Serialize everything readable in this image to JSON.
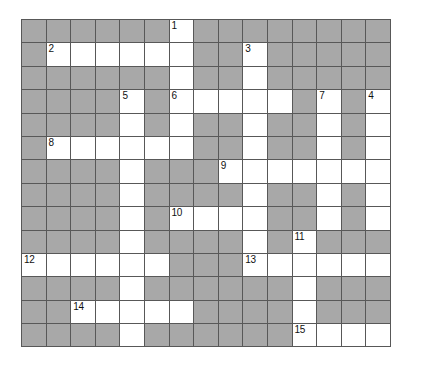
{
  "puzzle": {
    "title": "Crossword Grid",
    "rows": 14,
    "cols": 15,
    "colors": {
      "block": "#a8a8a8",
      "open": "#ffffff",
      "grid_line": "#585858",
      "number_text": "#111111",
      "page_background": "#ffffff"
    },
    "clue_numbers_visible": [
      "1",
      "2",
      "3",
      "4",
      "5",
      "6",
      "7",
      "8",
      "9",
      "10",
      "11",
      "12",
      "13",
      "14",
      "15"
    ],
    "cells": [
      [
        {
          "t": "block"
        },
        {
          "t": "block"
        },
        {
          "t": "block"
        },
        {
          "t": "block"
        },
        {
          "t": "block"
        },
        {
          "t": "block"
        },
        {
          "t": "open",
          "n": "1"
        },
        {
          "t": "block"
        },
        {
          "t": "block"
        },
        {
          "t": "block"
        },
        {
          "t": "block"
        },
        {
          "t": "block"
        },
        {
          "t": "block"
        },
        {
          "t": "block"
        },
        {
          "t": "block"
        }
      ],
      [
        {
          "t": "block"
        },
        {
          "t": "open",
          "n": "2"
        },
        {
          "t": "open"
        },
        {
          "t": "open"
        },
        {
          "t": "open"
        },
        {
          "t": "open"
        },
        {
          "t": "open"
        },
        {
          "t": "block"
        },
        {
          "t": "block"
        },
        {
          "t": "open",
          "n": "3"
        },
        {
          "t": "block"
        },
        {
          "t": "block"
        },
        {
          "t": "block"
        },
        {
          "t": "block"
        },
        {
          "t": "block"
        }
      ],
      [
        {
          "t": "block"
        },
        {
          "t": "block"
        },
        {
          "t": "block"
        },
        {
          "t": "block"
        },
        {
          "t": "block"
        },
        {
          "t": "block"
        },
        {
          "t": "open"
        },
        {
          "t": "block"
        },
        {
          "t": "block"
        },
        {
          "t": "open"
        },
        {
          "t": "block"
        },
        {
          "t": "block"
        },
        {
          "t": "block"
        },
        {
          "t": "block"
        },
        {
          "t": "block"
        }
      ],
      [
        {
          "t": "block"
        },
        {
          "t": "block"
        },
        {
          "t": "block"
        },
        {
          "t": "block"
        },
        {
          "t": "open",
          "n": "5"
        },
        {
          "t": "block"
        },
        {
          "t": "open",
          "n": "6"
        },
        {
          "t": "open"
        },
        {
          "t": "open"
        },
        {
          "t": "open"
        },
        {
          "t": "open"
        },
        {
          "t": "block"
        },
        {
          "t": "open",
          "n": "7"
        },
        {
          "t": "block"
        },
        {
          "t": "open",
          "n": "4"
        }
      ],
      [
        {
          "t": "block"
        },
        {
          "t": "block"
        },
        {
          "t": "block"
        },
        {
          "t": "block"
        },
        {
          "t": "open"
        },
        {
          "t": "block"
        },
        {
          "t": "open"
        },
        {
          "t": "block"
        },
        {
          "t": "block"
        },
        {
          "t": "open"
        },
        {
          "t": "block"
        },
        {
          "t": "block"
        },
        {
          "t": "open"
        },
        {
          "t": "block"
        },
        {
          "t": "open"
        }
      ],
      [
        {
          "t": "block"
        },
        {
          "t": "open",
          "n": "8"
        },
        {
          "t": "open"
        },
        {
          "t": "open"
        },
        {
          "t": "open"
        },
        {
          "t": "open"
        },
        {
          "t": "open"
        },
        {
          "t": "block"
        },
        {
          "t": "block"
        },
        {
          "t": "open"
        },
        {
          "t": "block"
        },
        {
          "t": "block"
        },
        {
          "t": "open"
        },
        {
          "t": "block"
        },
        {
          "t": "open"
        }
      ],
      [
        {
          "t": "block"
        },
        {
          "t": "block"
        },
        {
          "t": "block"
        },
        {
          "t": "block"
        },
        {
          "t": "open"
        },
        {
          "t": "block"
        },
        {
          "t": "block"
        },
        {
          "t": "block"
        },
        {
          "t": "open",
          "n": "9"
        },
        {
          "t": "open"
        },
        {
          "t": "open"
        },
        {
          "t": "open"
        },
        {
          "t": "open"
        },
        {
          "t": "open"
        },
        {
          "t": "open"
        }
      ],
      [
        {
          "t": "block"
        },
        {
          "t": "block"
        },
        {
          "t": "block"
        },
        {
          "t": "block"
        },
        {
          "t": "open"
        },
        {
          "t": "block"
        },
        {
          "t": "block"
        },
        {
          "t": "block"
        },
        {
          "t": "block"
        },
        {
          "t": "open"
        },
        {
          "t": "block"
        },
        {
          "t": "block"
        },
        {
          "t": "open"
        },
        {
          "t": "block"
        },
        {
          "t": "open"
        }
      ],
      [
        {
          "t": "block"
        },
        {
          "t": "block"
        },
        {
          "t": "block"
        },
        {
          "t": "block"
        },
        {
          "t": "open"
        },
        {
          "t": "block"
        },
        {
          "t": "open",
          "n": "10"
        },
        {
          "t": "open"
        },
        {
          "t": "open"
        },
        {
          "t": "open"
        },
        {
          "t": "block"
        },
        {
          "t": "block"
        },
        {
          "t": "open"
        },
        {
          "t": "block"
        },
        {
          "t": "open"
        }
      ],
      [
        {
          "t": "block"
        },
        {
          "t": "block"
        },
        {
          "t": "block"
        },
        {
          "t": "block"
        },
        {
          "t": "open"
        },
        {
          "t": "block"
        },
        {
          "t": "block"
        },
        {
          "t": "block"
        },
        {
          "t": "block"
        },
        {
          "t": "open"
        },
        {
          "t": "block"
        },
        {
          "t": "open",
          "n": "11"
        },
        {
          "t": "block"
        },
        {
          "t": "block"
        },
        {
          "t": "block"
        }
      ],
      [
        {
          "t": "open",
          "n": "12"
        },
        {
          "t": "open"
        },
        {
          "t": "open"
        },
        {
          "t": "open"
        },
        {
          "t": "open"
        },
        {
          "t": "open"
        },
        {
          "t": "block"
        },
        {
          "t": "block"
        },
        {
          "t": "block"
        },
        {
          "t": "open",
          "n": "13"
        },
        {
          "t": "open"
        },
        {
          "t": "open"
        },
        {
          "t": "open"
        },
        {
          "t": "open"
        },
        {
          "t": "open"
        }
      ],
      [
        {
          "t": "block"
        },
        {
          "t": "block"
        },
        {
          "t": "block"
        },
        {
          "t": "block"
        },
        {
          "t": "open"
        },
        {
          "t": "block"
        },
        {
          "t": "block"
        },
        {
          "t": "block"
        },
        {
          "t": "block"
        },
        {
          "t": "block"
        },
        {
          "t": "block"
        },
        {
          "t": "open"
        },
        {
          "t": "block"
        },
        {
          "t": "block"
        },
        {
          "t": "block"
        }
      ],
      [
        {
          "t": "block"
        },
        {
          "t": "block"
        },
        {
          "t": "open",
          "n": "14"
        },
        {
          "t": "open"
        },
        {
          "t": "open"
        },
        {
          "t": "open"
        },
        {
          "t": "open"
        },
        {
          "t": "block"
        },
        {
          "t": "block"
        },
        {
          "t": "block"
        },
        {
          "t": "block"
        },
        {
          "t": "open"
        },
        {
          "t": "block"
        },
        {
          "t": "block"
        },
        {
          "t": "block"
        }
      ],
      [
        {
          "t": "block"
        },
        {
          "t": "block"
        },
        {
          "t": "block"
        },
        {
          "t": "block"
        },
        {
          "t": "open"
        },
        {
          "t": "block"
        },
        {
          "t": "block"
        },
        {
          "t": "block"
        },
        {
          "t": "block"
        },
        {
          "t": "block"
        },
        {
          "t": "block"
        },
        {
          "t": "open",
          "n": "15"
        },
        {
          "t": "open"
        },
        {
          "t": "open"
        },
        {
          "t": "open"
        }
      ]
    ]
  }
}
